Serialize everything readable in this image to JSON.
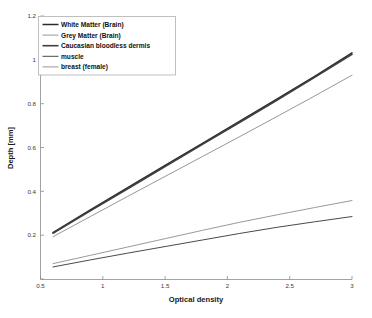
{
  "chart_data": {
    "type": "line",
    "title": "",
    "xlabel": "Optical density",
    "ylabel": "Depth [mm]",
    "xlim": [
      0.5,
      3.0
    ],
    "ylim": [
      0.0,
      1.2
    ],
    "xticks": [
      0.5,
      1,
      1.5,
      2,
      2.5,
      3
    ],
    "xticklabels": [
      "0.5",
      "1",
      "1.5",
      "2",
      "2.5",
      "3"
    ],
    "yticks": [
      0.2,
      0.4,
      0.6,
      0.8,
      1.0,
      1.2
    ],
    "yticklabels": [
      "0.2",
      "0.4",
      "0.6",
      "0.8",
      "1",
      "1.2"
    ],
    "grid": false,
    "legend_position": "upper left",
    "x": [
      0.6,
      0.9,
      1.2,
      1.5,
      1.8,
      2.1,
      2.4,
      2.7,
      3.0
    ],
    "series": [
      {
        "name": "White Matter (Brain)",
        "color": "#2b2b2b",
        "linewidth": 1.5,
        "values": [
          0.212,
          0.315,
          0.417,
          0.518,
          0.619,
          0.72,
          0.822,
          0.925,
          1.032
        ]
      },
      {
        "name": "Grey Matter (Brain)",
        "color": "#8a8a8a",
        "linewidth": 0.9,
        "values": [
          0.193,
          0.285,
          0.377,
          0.468,
          0.559,
          0.65,
          0.742,
          0.835,
          0.93
        ]
      },
      {
        "name": "Caucasian bloodless dermis",
        "color": "#3f3f3f",
        "linewidth": 1.6,
        "values": [
          0.209,
          0.311,
          0.412,
          0.513,
          0.614,
          0.715,
          0.817,
          0.92,
          1.025
        ]
      },
      {
        "name": "muscle",
        "color": "#4a4a4a",
        "linewidth": 1.0,
        "values": [
          0.055,
          0.087,
          0.118,
          0.148,
          0.178,
          0.208,
          0.236,
          0.261,
          0.285
        ]
      },
      {
        "name": "breast (female)",
        "color": "#9a9a9a",
        "linewidth": 1.0,
        "values": [
          0.07,
          0.108,
          0.146,
          0.184,
          0.222,
          0.259,
          0.293,
          0.326,
          0.358
        ]
      }
    ]
  },
  "legend": {
    "entries": [
      {
        "label": "White Matter (Brain)"
      },
      {
        "label": "Grey Matter (Brain)"
      },
      {
        "label": "Caucasian bloodless dermis"
      },
      {
        "label": "muscle"
      },
      {
        "label": "breast (female)"
      }
    ]
  },
  "axes": {
    "x_title": "Optical density",
    "y_title": "Depth [mm]",
    "x_tick_labels": [
      "0.5",
      "1",
      "1.5",
      "2",
      "2.5",
      "3"
    ],
    "y_tick_labels": [
      "0.2",
      "0.4",
      "0.6",
      "0.8",
      "1",
      "1.2"
    ]
  },
  "colors": {
    "axis": "#8c8c8c",
    "text": "#1a1a1a",
    "background": "#ffffff"
  }
}
